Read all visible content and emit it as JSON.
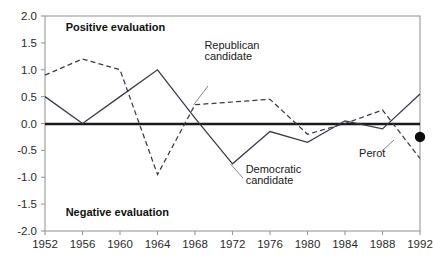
{
  "chart_data": {
    "type": "line",
    "title": "",
    "xlabel": "",
    "ylabel": "",
    "x": [
      1952,
      1956,
      1960,
      1964,
      1968,
      1972,
      1976,
      1980,
      1984,
      1988,
      1992
    ],
    "xlim": [
      1952,
      1992
    ],
    "ylim": [
      -2.0,
      2.0
    ],
    "grid": false,
    "legend_position": "inline-annotations",
    "yticks": [
      "2.0",
      "1.5",
      "1.0",
      "0.5",
      "0.0",
      "-0.5",
      "-1.0",
      "-1.5",
      "-2.0"
    ],
    "ytick_values": [
      2.0,
      1.5,
      1.0,
      0.5,
      0.0,
      -0.5,
      -1.0,
      -1.5,
      -2.0
    ],
    "xticks": [
      "1952",
      "1956",
      "1960",
      "1964",
      "1968",
      "1972",
      "1976",
      "1980",
      "1984",
      "1988",
      "1992"
    ],
    "series": [
      {
        "name": "Republican candidate",
        "style": "solid",
        "values": [
          0.5,
          0.0,
          0.5,
          1.0,
          0.1,
          -0.75,
          -0.15,
          -0.35,
          0.05,
          -0.1,
          0.55
        ]
      },
      {
        "name": "Democratic candidate",
        "style": "dashed",
        "values": [
          0.9,
          1.2,
          1.0,
          -0.95,
          0.35,
          0.4,
          0.45,
          -0.2,
          0.0,
          0.25,
          -0.65
        ]
      },
      {
        "name": "Perot",
        "style": "point",
        "values": [
          null,
          null,
          null,
          null,
          null,
          null,
          null,
          null,
          null,
          null,
          -0.25
        ]
      }
    ],
    "annotations": [
      {
        "text": "Positive evaluation",
        "x": 1954.2,
        "y": 1.73
      },
      {
        "text": "Negative evaluation",
        "x": 1954.2,
        "y": -1.73
      },
      {
        "text": "Republican",
        "x": 1969.0,
        "y": 1.38
      },
      {
        "text": "candidate",
        "x": 1969.0,
        "y": 1.18
      },
      {
        "text": "Democratic",
        "x": 1973.4,
        "y": -0.93
      },
      {
        "text": "candidate",
        "x": 1973.4,
        "y": -1.13
      },
      {
        "text": "Perot",
        "x": 1985.5,
        "y": -0.62
      }
    ],
    "colors": {
      "series_line": "#3a3a4a",
      "zero_line": "#1a1a1a",
      "frame": "#9a9a9a",
      "text": "#1a1a1a",
      "perot_dot": "#0d0d0d",
      "background": "#ffffff"
    }
  }
}
